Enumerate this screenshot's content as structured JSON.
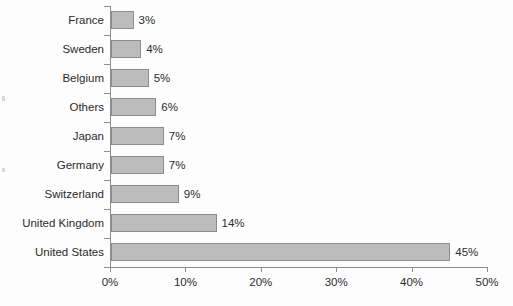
{
  "chart_data": {
    "type": "bar",
    "orientation": "horizontal",
    "title": "",
    "subtitle": "",
    "xlabel": "",
    "ylabel": "",
    "categories": [
      "France",
      "Sweden",
      "Belgium",
      "Others",
      "Japan",
      "Germany",
      "Switzerland",
      "United Kingdom",
      "United States"
    ],
    "values": [
      3,
      4,
      5,
      6,
      7,
      7,
      9,
      14,
      45
    ],
    "value_labels": [
      "3%",
      "4%",
      "5%",
      "6%",
      "7%",
      "7%",
      "9%",
      "14%",
      "45%"
    ],
    "xlim": [
      0,
      50
    ],
    "xticks": [
      0,
      10,
      20,
      30,
      40,
      50
    ],
    "xtick_labels": [
      "0%",
      "10%",
      "20%",
      "30%",
      "40%",
      "50%"
    ],
    "grid": false,
    "legend": null,
    "legend_position": "none",
    "series": [
      {
        "name": "Share",
        "values": [
          3,
          4,
          5,
          6,
          7,
          7,
          9,
          14,
          45
        ]
      }
    ],
    "colors": {
      "bar_fill": "#bcbcbc",
      "bar_border": "#8c8c8c",
      "axis": "#8e8e8e",
      "text": "#2b2b2b",
      "background": "#fdfdfd"
    }
  }
}
